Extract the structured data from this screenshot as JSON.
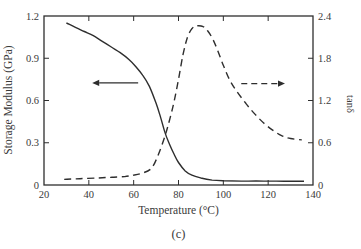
{
  "figure": {
    "caption": "(c)"
  },
  "chart_data": {
    "type": "line",
    "title": "",
    "xlabel": "Temperature (°C)",
    "ylabel_left": "Storage Modulus (GPa)",
    "ylabel_right": "tanδ",
    "xlim": [
      20,
      140
    ],
    "ylim_left": [
      0,
      1.2
    ],
    "ylim_right": [
      0,
      2.4
    ],
    "x_ticks": [
      20,
      40,
      60,
      80,
      100,
      120,
      140
    ],
    "y_ticks_left": [
      0,
      0.3,
      0.6,
      0.9,
      1.2
    ],
    "y_ticks_right": [
      0,
      0.6,
      1.2,
      1.8,
      2.4
    ],
    "grid": false,
    "legend": "none",
    "colors": {
      "line": "#2e2e2e",
      "text": "#3a3a3a"
    },
    "series": [
      {
        "name": "Storage Modulus",
        "axis": "left",
        "line_style": "solid",
        "x": [
          30,
          34,
          38,
          42,
          46,
          50,
          54,
          58,
          61,
          64,
          67,
          70,
          72,
          74,
          76,
          78,
          80,
          83,
          86,
          90,
          95,
          100,
          108,
          118,
          127,
          136
        ],
        "y": [
          1.15,
          1.12,
          1.09,
          1.06,
          1.02,
          0.98,
          0.94,
          0.89,
          0.84,
          0.78,
          0.7,
          0.58,
          0.48,
          0.37,
          0.29,
          0.22,
          0.16,
          0.1,
          0.07,
          0.05,
          0.035,
          0.03,
          0.028,
          0.028,
          0.027,
          0.027
        ]
      },
      {
        "name": "tan δ",
        "axis": "right",
        "line_style": "dashed",
        "x": [
          29,
          36,
          44,
          50,
          56,
          60,
          64,
          68,
          71,
          74,
          76,
          78,
          80,
          82,
          84,
          86,
          88,
          91,
          93,
          95,
          97,
          100,
          103,
          106,
          110,
          114,
          118,
          122,
          126,
          130,
          135
        ],
        "y": [
          0.08,
          0.09,
          0.1,
          0.11,
          0.12,
          0.14,
          0.17,
          0.24,
          0.43,
          0.7,
          0.92,
          1.18,
          1.5,
          1.85,
          2.1,
          2.22,
          2.26,
          2.25,
          2.19,
          2.09,
          1.95,
          1.7,
          1.48,
          1.33,
          1.16,
          1.01,
          0.88,
          0.78,
          0.7,
          0.66,
          0.64
        ]
      }
    ],
    "annotations": [
      {
        "name": "storage-modulus-arrow",
        "type": "arrow",
        "line_style": "solid",
        "axis": "left",
        "y": 0.725,
        "x_tail": 62,
        "x_head": 41.5,
        "direction": "left"
      },
      {
        "name": "tan-delta-arrow",
        "type": "arrow",
        "line_style": "dashed",
        "axis": "right",
        "y": 1.44,
        "x_tail": 108,
        "x_head": 127.5,
        "direction": "right"
      }
    ]
  }
}
